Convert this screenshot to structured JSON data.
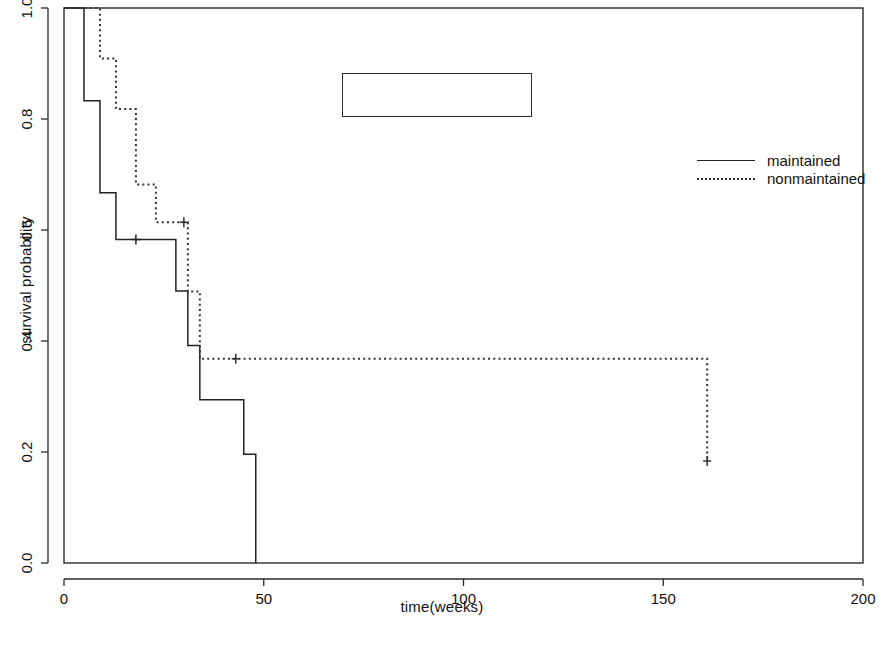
{
  "chart_data": {
    "type": "line",
    "title": "",
    "subtitle": "",
    "xlabel": "time(weeks)",
    "ylabel": "survival probability",
    "xlim": [
      0,
      200
    ],
    "ylim": [
      0.0,
      1.0
    ],
    "xticks": [
      0,
      50,
      100,
      150,
      200
    ],
    "xtick_labels": [
      "0",
      "50",
      "100",
      "150",
      "200"
    ],
    "yticks": [
      0.0,
      0.2,
      0.4,
      0.6,
      0.8,
      1.0
    ],
    "ytick_labels": [
      "0.0",
      "0.2",
      "0.4",
      "0.6",
      "0.8",
      "1.0"
    ],
    "grid": false,
    "legend_position": "top-center",
    "step_style": "post",
    "series": [
      {
        "name": "maintained",
        "linestyle": "solid",
        "color": "#222222",
        "x": [
          0,
          5,
          9,
          13,
          18,
          23,
          28,
          31,
          34,
          45,
          48
        ],
        "y": [
          1.0,
          0.833,
          0.667,
          0.583,
          0.583,
          0.583,
          0.49,
          0.392,
          0.294,
          0.196,
          0.0
        ],
        "censored_points": [
          {
            "x": 18,
            "y": 0.583
          }
        ],
        "terminal_x": 48,
        "terminal_y": 0.0
      },
      {
        "name": "nonmaintained",
        "linestyle": "dotted",
        "color": "#333333",
        "x": [
          0,
          9,
          13,
          18,
          23,
          28,
          31,
          34,
          48,
          161
        ],
        "y": [
          1.0,
          0.909,
          0.818,
          0.682,
          0.614,
          0.614,
          0.489,
          0.368,
          0.368,
          0.184
        ],
        "censored_points": [
          {
            "x": 30,
            "y": 0.614
          },
          {
            "x": 43,
            "y": 0.368
          },
          {
            "x": 161,
            "y": 0.184
          }
        ],
        "terminal_x": 161,
        "terminal_y": 0.184
      }
    ],
    "legend_entries": [
      "maintained",
      "nonmaintained"
    ],
    "plot_frame": {
      "left": 64,
      "top": 8,
      "right": 863,
      "bottom": 563
    }
  },
  "colors": {
    "background": "#ffffff",
    "frame": "#2a2a2a",
    "maintained": "#222222",
    "nonmaintained": "#333333",
    "text": "#111111"
  }
}
